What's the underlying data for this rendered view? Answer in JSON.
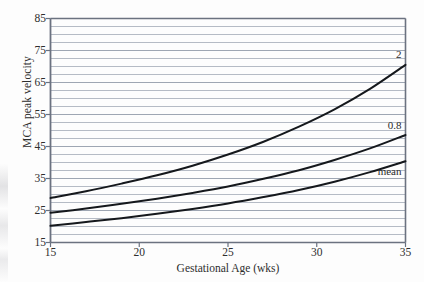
{
  "figure": {
    "background_color": "#fdfdfd",
    "plot_background_color": "#ffffff",
    "gridline_color": "#9aa3b0",
    "frame_color": "#6b7280",
    "curve_color": "#15181c"
  },
  "chart_data": {
    "type": "line",
    "title": "",
    "xlabel": "Gestational Age (wks)",
    "ylabel": "MCA peak velocity",
    "xlim": [
      15,
      35
    ],
    "ylim": [
      15,
      85
    ],
    "xticks": [
      15,
      20,
      25,
      30,
      35
    ],
    "yticks": [
      15,
      25,
      35,
      45,
      55,
      65,
      75,
      85
    ],
    "xtick_labels": [
      "15",
      "20",
      "25",
      "30",
      "35"
    ],
    "ytick_labels": [
      "15",
      "25",
      "35",
      "45",
      "55",
      "65",
      "75",
      "85"
    ],
    "grid": true,
    "grid_axis": "y",
    "grid_minor_step": 2.5,
    "legend_position": "inline-right",
    "x": [
      15,
      17,
      19,
      21,
      23,
      25,
      27,
      29,
      31,
      33,
      35
    ],
    "series": [
      {
        "name": "2",
        "label": "2",
        "values": [
          28.9,
          31.0,
          33.4,
          36.0,
          39.0,
          42.5,
          46.5,
          51.2,
          56.6,
          63.0,
          70.5
        ]
      },
      {
        "name": "0.8",
        "label": "0.8",
        "values": [
          24.3,
          25.6,
          27.1,
          28.7,
          30.5,
          32.5,
          34.9,
          37.6,
          40.8,
          44.4,
          48.6
        ]
      },
      {
        "name": "mean",
        "label": "mean",
        "values": [
          20.2,
          21.4,
          22.6,
          24.0,
          25.5,
          27.2,
          29.2,
          31.4,
          34.0,
          37.0,
          40.4
        ]
      }
    ],
    "annotations": [
      {
        "text": "2",
        "x": 35,
        "y": 73.5
      },
      {
        "text": "0.8",
        "x": 35,
        "y": 51.5
      },
      {
        "text": "mean",
        "x": 35,
        "y": 37.0
      }
    ]
  }
}
